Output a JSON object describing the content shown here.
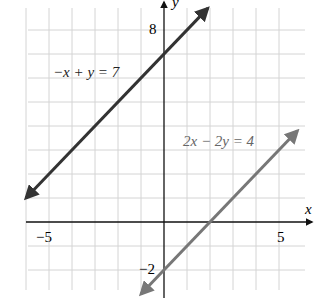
{
  "chart_data": {
    "type": "line",
    "title": "",
    "xlabel": "x",
    "ylabel": "y",
    "xlim": [
      -6,
      6
    ],
    "ylim": [
      -3,
      9
    ],
    "grid": true,
    "x_tick_labels": [
      "-5",
      "5"
    ],
    "y_tick_labels": [
      "8",
      "-2"
    ],
    "series": [
      {
        "name": "-x + y = 7",
        "equation": "y = x + 7",
        "color": "#333333",
        "points": [
          [
            -6,
            1
          ],
          [
            1.9,
            8.9
          ]
        ]
      },
      {
        "name": "2x - 2y = 4",
        "equation": "y = x - 2",
        "color": "#777777",
        "points": [
          [
            -1,
            -3
          ],
          [
            5.8,
            3.8
          ]
        ]
      }
    ],
    "annotations": [
      {
        "text": "-x + y = 7",
        "x": -4.9,
        "y": 6.2
      },
      {
        "text": "2x - 2y = 4",
        "x": 0.8,
        "y": 2.8
      }
    ]
  },
  "labels": {
    "x_axis": "x",
    "y_axis": "y",
    "tick_neg5": "−5",
    "tick_5": "5",
    "tick_8": "8",
    "tick_neg2": "−2",
    "eq1": "−x + y = 7",
    "eq2": "2x − 2y = 4"
  }
}
